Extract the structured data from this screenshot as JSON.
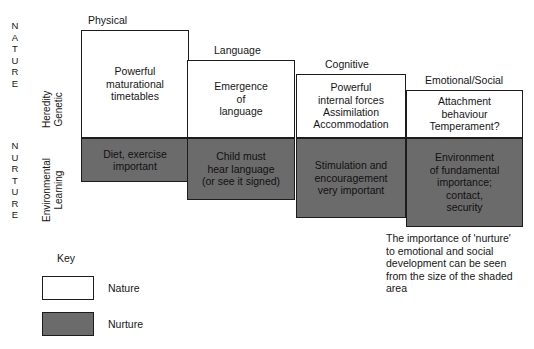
{
  "diagram": {
    "title_axis": {
      "nature_letters": [
        "N",
        "A",
        "T",
        "U",
        "R",
        "E"
      ],
      "nurture_letters": [
        "N",
        "U",
        "R",
        "T",
        "U",
        "R",
        "E"
      ],
      "nature_sub_line1": "Heredity",
      "nature_sub_line2": "Genetic",
      "nurture_sub_line1": "Environmental",
      "nurture_sub_line2": "Learning"
    },
    "columns": [
      {
        "header": "Physical",
        "nature_lines": [
          "Powerful",
          "maturational",
          "timetables"
        ],
        "nurture_lines": [
          "Diet, exercise",
          "important"
        ]
      },
      {
        "header": "Language",
        "nature_lines": [
          "Emergence",
          "of",
          "language"
        ],
        "nurture_lines": [
          "Child must",
          "hear language",
          "(or see it signed)"
        ]
      },
      {
        "header": "Cognitive",
        "nature_lines": [
          "Powerful",
          "internal forces",
          "Assimilation",
          "Accommodation"
        ],
        "nurture_lines": [
          "Stimulation and",
          "encouragement",
          "very important"
        ]
      },
      {
        "header": "Emotional/Social",
        "nature_lines": [
          "Attachment",
          "behaviour",
          "Temperament?"
        ],
        "nurture_lines": [
          "Environment",
          "of fundamental",
          "importance;",
          "contact,",
          "security"
        ]
      }
    ],
    "key": {
      "title": "Key",
      "nature_label": "Nature",
      "nurture_label": "Nurture"
    },
    "caption": "The importance of 'nurture' to emotional and social development can be seen from the size of the shaded area",
    "colors": {
      "nurture_fill": "#6b6b6b",
      "nature_fill": "#ffffff",
      "stroke": "#1c1c1c",
      "text": "#161616"
    }
  }
}
